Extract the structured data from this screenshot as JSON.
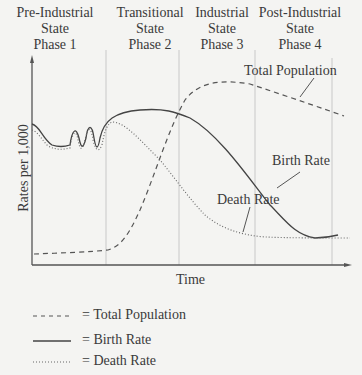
{
  "phases": [
    {
      "line1": "Pre-Industrial",
      "line2": "State",
      "line3": "Phase 1"
    },
    {
      "line1": "Transitional",
      "line2": "State",
      "line3": "Phase 2"
    },
    {
      "line1": "Industrial",
      "line2": "State",
      "line3": "Phase 3"
    },
    {
      "line1": "Post-Industrial",
      "line2": "State",
      "line3": "Phase 4"
    }
  ],
  "axes": {
    "ylabel": "Rates per 1,000",
    "xlabel": "Time"
  },
  "annotations": {
    "total_population": "Total Population",
    "birth_rate": "Birth Rate",
    "death_rate": "Death Rate"
  },
  "legend": [
    {
      "style": "dashed",
      "label": "= Total Population"
    },
    {
      "style": "solid",
      "label": "= Birth Rate"
    },
    {
      "style": "dotted",
      "label": "= Death Rate"
    }
  ],
  "colors": {
    "line": "#444444",
    "divider": "#c8c8c8",
    "background": "#f4f4f2"
  }
}
